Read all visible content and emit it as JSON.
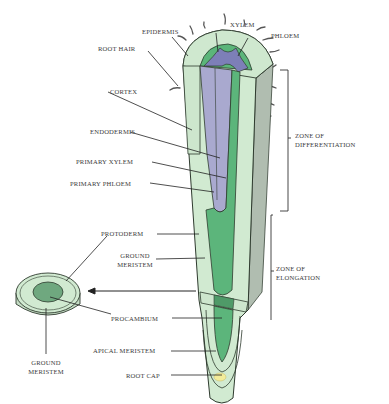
{
  "figure": {
    "colors": {
      "cortex": "#cfe8cf",
      "cortex_dark": "#b7d7b7",
      "xylem": "#a9a9cf",
      "phloem": "#5ab579",
      "procambium": "#5cb57b",
      "epidermis_shade": "#a9b9a9",
      "apical_meristem": "#f3ec9a",
      "outline": "#2f3b2f",
      "leader": "#222222"
    },
    "labels": {
      "epidermis": "EPIDERMIS",
      "xylem": "XYLEM",
      "phloem": "PHLOEM",
      "root_hair": "ROOT HAIR",
      "cortex": "CORTEX",
      "endodermis": "ENDODERMIS",
      "primary_xylem": "PRIMARY XYLEM",
      "primary_phloem": "PRIMARY PHLOEM",
      "zone_differentiation_1": "ZONE OF",
      "zone_differentiation_2": "DIFFERENTIATION",
      "protoderm": "PROTODERM",
      "ground_meristem_1": "GROUND",
      "ground_meristem_2": "MERISTEM",
      "zone_elongation_1": "ZONE OF",
      "zone_elongation_2": "ELONGATION",
      "procambium": "PROCAMBIUM",
      "apical_meristem": "APICAL MERISTEM",
      "root_cap": "ROOT CAP",
      "cross_ground_meristem_1": "GROUND",
      "cross_ground_meristem_2": "MERISTEM"
    }
  }
}
